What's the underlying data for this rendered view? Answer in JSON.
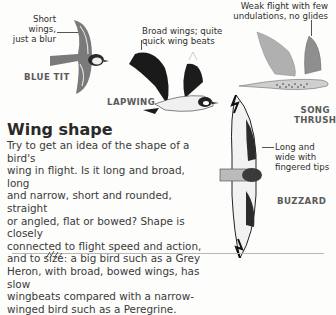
{
  "birds": [
    {
      "name": "BLUE TIT",
      "caption_lines": [
        "Short wings,",
        "just a blur"
      ]
    },
    {
      "name": "LAPWING",
      "caption_lines": [
        "Broad wings; quite",
        "quick wing beats"
      ]
    },
    {
      "name_lines": [
        "SONG",
        "THRUSH"
      ],
      "caption_lines": [
        "Weak flight with few",
        "undulations, no glides"
      ]
    },
    {
      "name": "BUZZARD",
      "caption_lines": [
        "Long and",
        "wide with",
        "fingered tips"
      ]
    }
  ],
  "section": {
    "title": "Wing shape",
    "body_lines": [
      "Try to get an idea of the shape of a bird's",
      "wing in flight. Is it long and broad, long",
      "and narrow, short and rounded, straight",
      "or angled, flat or bowed? Shape is closely",
      "connected to flight speed and action,",
      "and to size: a big bird such as a Grey",
      "Heron, with broad, bowed wings, has slow",
      "wingbeats compared with a narrow-",
      "winged bird such as a Peregrine."
    ]
  },
  "colors": {
    "blue_tit_body": "#7a7a7a",
    "lapwing_wing": "#1a1a1a",
    "thrush_wing": "#a9a9a9",
    "buzzard_wing": "#2b2b2b"
  }
}
